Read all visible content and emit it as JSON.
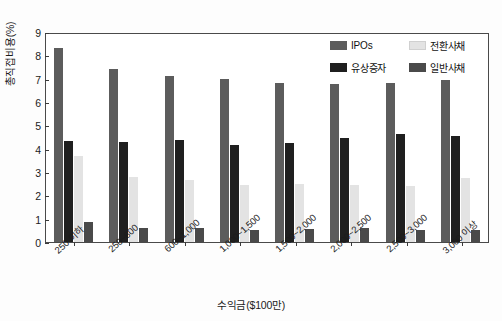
{
  "chart_data": {
    "type": "bar",
    "title": "",
    "xlabel": "수익금($100만)",
    "ylabel": "총직접비용(%)",
    "ylim": [
      0,
      9
    ],
    "yticks": [
      0,
      1,
      2,
      3,
      4,
      5,
      6,
      7,
      8,
      9
    ],
    "grid": false,
    "legend_position": "top-right",
    "categories": [
      "250 이하",
      "250~600",
      "600~1,000",
      "1,000~1,500",
      "1,500~2,000",
      "2,000~2,500",
      "2,500~3,000",
      "3,000 이상"
    ],
    "series": [
      {
        "name": "IPOs",
        "color": "#5c5c5c",
        "values": [
          8.32,
          7.42,
          7.13,
          6.98,
          6.82,
          6.78,
          6.8,
          6.95
        ]
      },
      {
        "name": "유상증자",
        "color": "#1f1f1f",
        "values": [
          4.35,
          4.3,
          4.37,
          4.15,
          4.25,
          4.45,
          4.62,
          4.55
        ]
      },
      {
        "name": "전환사채",
        "color": "#e3e3e3",
        "values": [
          3.7,
          2.8,
          2.65,
          2.45,
          2.48,
          2.45,
          2.42,
          2.75
        ]
      },
      {
        "name": "일반사채",
        "color": "#4a4a4a",
        "values": [
          0.85,
          0.6,
          0.58,
          0.52,
          0.55,
          0.58,
          0.52,
          0.5
        ]
      }
    ]
  },
  "legend": {
    "items": [
      {
        "label": "IPOs",
        "color": "#5c5c5c"
      },
      {
        "label": "전환사채",
        "color": "#e3e3e3"
      },
      {
        "label": "유상증자",
        "color": "#1f1f1f"
      },
      {
        "label": "일반사채",
        "color": "#4a4a4a"
      }
    ]
  }
}
